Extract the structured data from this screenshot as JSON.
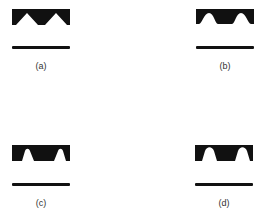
{
  "figure": {
    "panels": [
      {
        "id": "a",
        "label": "(a)",
        "profile": "triangular-notch"
      },
      {
        "id": "b",
        "label": "(b)",
        "profile": "rounded-notch"
      },
      {
        "id": "c",
        "label": "(c)",
        "profile": "trapezoidal-notch"
      },
      {
        "id": "d",
        "label": "(d)",
        "profile": "tall-rounded-notch"
      }
    ],
    "colors": {
      "shape": "#111111",
      "background": "#ffffff",
      "label": "#333333"
    }
  }
}
